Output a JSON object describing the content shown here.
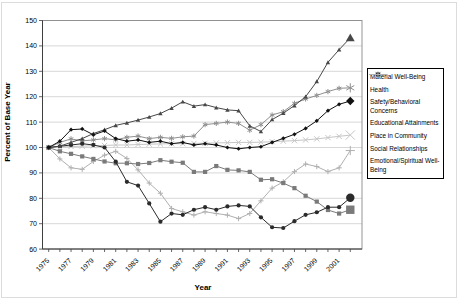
{
  "chart_data": {
    "type": "line",
    "title": "",
    "xlabel": "Year",
    "ylabel": "Percent of Base Year",
    "ylim": [
      60,
      150
    ],
    "y_ticks": [
      60,
      70,
      80,
      90,
      100,
      110,
      120,
      130,
      140,
      150
    ],
    "x_tick_years": [
      1975,
      1977,
      1979,
      1981,
      1983,
      1985,
      1987,
      1989,
      1991,
      1993,
      1995,
      1997,
      1999,
      2001
    ],
    "grid": "horizontal",
    "legend_position": "right",
    "final_point_emphasis": true,
    "x": [
      1975,
      1976,
      1977,
      1978,
      1979,
      1980,
      1981,
      1982,
      1983,
      1984,
      1985,
      1986,
      1987,
      1988,
      1989,
      1990,
      1991,
      1992,
      1993,
      1994,
      1995,
      1996,
      1997,
      1998,
      1999,
      2000,
      2001,
      2002
    ],
    "series": [
      {
        "id": "material-well-being",
        "name": "Material Well-Being",
        "marker": "diamond",
        "color": "#111111",
        "values": [
          100,
          102.5,
          107,
          107.3,
          105,
          106.5,
          103.5,
          102.5,
          103,
          102,
          102.5,
          101.5,
          102,
          101,
          101.5,
          101,
          100,
          99.5,
          100,
          100.3,
          102,
          103.6,
          105.2,
          107.5,
          110.5,
          114.5,
          117,
          118.3
        ]
      },
      {
        "id": "health",
        "name": "Health",
        "marker": "square",
        "color": "#7a7a7a",
        "values": [
          100,
          98.5,
          97.5,
          96.5,
          95.5,
          94.5,
          93.8,
          93.8,
          93.5,
          93.9,
          95,
          94.4,
          94,
          90.4,
          90.4,
          92.7,
          91.2,
          91,
          90.4,
          87.3,
          87.5,
          86,
          84,
          81,
          78.7,
          75.4,
          74,
          75.5
        ]
      },
      {
        "id": "safety-behavioral-concerns",
        "name": "Safety/Behavioral Concerns",
        "marker": "triangle",
        "color": "#484848",
        "values": [
          100,
          100.5,
          102,
          103.5,
          105.5,
          107,
          108.7,
          109.7,
          110.8,
          112,
          113.4,
          115.5,
          118,
          116.3,
          116.9,
          115.7,
          114.8,
          114.5,
          108.5,
          106.3,
          111,
          113.5,
          116.5,
          120,
          126,
          133.5,
          138.5,
          143.2
        ]
      },
      {
        "id": "educational-attainments",
        "name": "Educational Attainments",
        "marker": "x",
        "color": "#c6c6c6",
        "values": [
          100,
          100.2,
          100.4,
          100.5,
          100.7,
          100.8,
          101,
          101,
          101.2,
          101.3,
          101.4,
          101.5,
          101.5,
          101.6,
          101.7,
          101.8,
          101.9,
          102,
          102,
          102.1,
          102.3,
          102.5,
          102.7,
          103,
          103.4,
          103.9,
          104.4,
          104.9
        ]
      },
      {
        "id": "place-in-community",
        "name": "Place in Community",
        "marker": "asterisk",
        "color": "#8f8f8f",
        "values": [
          100,
          102,
          103.4,
          102.6,
          103,
          103.5,
          103,
          104,
          104.5,
          103.5,
          104,
          103.6,
          104.2,
          104.5,
          109,
          109.5,
          110,
          109.5,
          106.8,
          109,
          112.8,
          114.1,
          117.4,
          119.1,
          120.5,
          122,
          123.3,
          123.5
        ]
      },
      {
        "id": "social-relationships",
        "name": "Social Relationships",
        "marker": "circle",
        "color": "#2b2b2b",
        "values": [
          100,
          100.5,
          101,
          101.5,
          101,
          100,
          94.4,
          86.5,
          85,
          78,
          70.8,
          74,
          73.5,
          75.5,
          76.5,
          75.5,
          76.8,
          77.2,
          76.8,
          72.5,
          68.6,
          68.3,
          71,
          73.5,
          74.5,
          76.5,
          76.5,
          80.2
        ]
      },
      {
        "id": "emotional-spiritual-well-being",
        "name": "Emotional/Spiritual Well-Being",
        "marker": "plus",
        "color": "#b0b0b0",
        "values": [
          100,
          95.5,
          92,
          91.4,
          94.5,
          97,
          98.5,
          95.7,
          91.2,
          86,
          82,
          76,
          74.7,
          73.4,
          74.7,
          74,
          73.4,
          72,
          74,
          79,
          84,
          86.5,
          90.5,
          93.5,
          92.5,
          90.5,
          92,
          98.8
        ]
      }
    ]
  },
  "legend": {
    "items": [
      {
        "label": "Material Well-Being"
      },
      {
        "label": "Health"
      },
      {
        "label": "Safety/Behavioral Concerns"
      },
      {
        "label": "Educational Attainments"
      },
      {
        "label": "Place in Community"
      },
      {
        "label": "Social Relationships"
      },
      {
        "label": "Emotional/Spiritual Well-Being"
      }
    ]
  }
}
